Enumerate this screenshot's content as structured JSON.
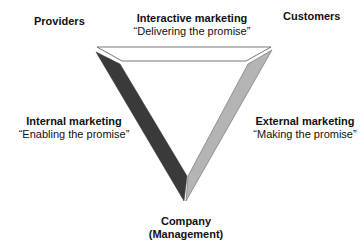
{
  "diagram": {
    "type": "services-marketing-triangle",
    "vertices": {
      "top_left": "Providers",
      "top_right": "Customers",
      "bottom": [
        "Company",
        "(Management)"
      ]
    },
    "edges": {
      "top": {
        "title": "Interactive marketing",
        "subtitle": "“Delivering the promise”"
      },
      "left": {
        "title": "Internal marketing",
        "subtitle": "“Enabling the promise”"
      },
      "right": {
        "title": "External marketing",
        "subtitle": "“Making the promise”"
      }
    },
    "colors": {
      "top_bar": "#ffffff",
      "left_bar": "#3a3a3a",
      "right_bar": "#b4b4b4",
      "outline": "#555555"
    }
  }
}
